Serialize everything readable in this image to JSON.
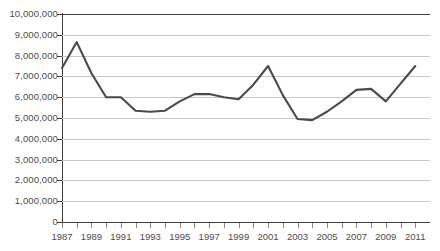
{
  "chart_data": {
    "type": "line",
    "title": "",
    "xlabel": "",
    "ylabel": "",
    "grid": true,
    "legend": false,
    "ylim": [
      0,
      10000000
    ],
    "ytick_step": 1000000,
    "ytick_labels": [
      "10,000,000",
      "9,000,000",
      "8,000,000",
      "7,000,000",
      "6,000,000",
      "5,000,000",
      "4,000,000",
      "3,000,000",
      "2,000,000",
      "1,000,000",
      "0"
    ],
    "ytick_values": [
      10000000,
      9000000,
      8000000,
      7000000,
      6000000,
      5000000,
      4000000,
      3000000,
      2000000,
      1000000,
      0
    ],
    "xlim": [
      1987,
      2012
    ],
    "x": [
      1987,
      1988,
      1989,
      1990,
      1991,
      1992,
      1993,
      1994,
      1995,
      1996,
      1997,
      1998,
      1999,
      2000,
      2001,
      2002,
      2003,
      2004,
      2005,
      2006,
      2007,
      2008,
      2009,
      2010,
      2011
    ],
    "xtick_labels": [
      "1987",
      "1989",
      "1991",
      "1993",
      "1995",
      "1997",
      "1999",
      "2001",
      "2003",
      "2005",
      "2007",
      "2009",
      "2011"
    ],
    "xtick_label_values": [
      1987,
      1989,
      1991,
      1993,
      1995,
      1997,
      1999,
      2001,
      2003,
      2005,
      2007,
      2009,
      2011
    ],
    "values": [
      7400000,
      8650000,
      7150000,
      6000000,
      6000000,
      5350000,
      5300000,
      5350000,
      5800000,
      6150000,
      6150000,
      6000000,
      5900000,
      6600000,
      7500000,
      6100000,
      4950000,
      4900000,
      5300000,
      5800000,
      6350000,
      6400000,
      5800000,
      6650000,
      7500000
    ],
    "series_color": "#4a4a4a",
    "gridline_color": "#c9c9c9",
    "axis_color": "#3f3f3f",
    "label_color": "#4d4d4d",
    "background_color": "#ffffff"
  }
}
